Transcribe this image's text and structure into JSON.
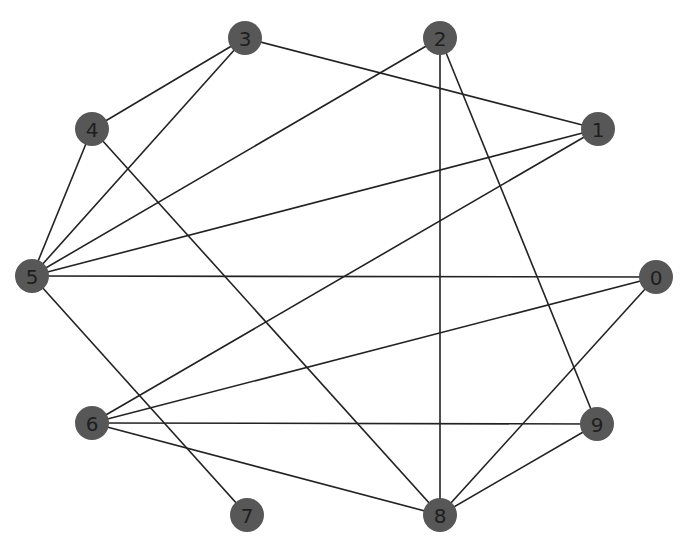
{
  "graph": {
    "node_radius": 17,
    "colors": {
      "node_fill": "#575757",
      "label": "#1e1e1e",
      "edge": "#222222",
      "background": "#ffffff"
    },
    "nodes": [
      {
        "id": "0",
        "label": "0",
        "x": 656,
        "y": 277
      },
      {
        "id": "1",
        "label": "1",
        "x": 598,
        "y": 129
      },
      {
        "id": "2",
        "label": "2",
        "x": 440,
        "y": 38
      },
      {
        "id": "3",
        "label": "3",
        "x": 245,
        "y": 38
      },
      {
        "id": "4",
        "label": "4",
        "x": 92,
        "y": 129
      },
      {
        "id": "5",
        "label": "5",
        "x": 32,
        "y": 276
      },
      {
        "id": "6",
        "label": "6",
        "x": 92,
        "y": 423
      },
      {
        "id": "7",
        "label": "7",
        "x": 247,
        "y": 515
      },
      {
        "id": "8",
        "label": "8",
        "x": 440,
        "y": 515
      },
      {
        "id": "9",
        "label": "9",
        "x": 597,
        "y": 424
      }
    ],
    "edges": [
      [
        "3",
        "4"
      ],
      [
        "3",
        "5"
      ],
      [
        "3",
        "1"
      ],
      [
        "2",
        "5"
      ],
      [
        "2",
        "8"
      ],
      [
        "2",
        "9"
      ],
      [
        "1",
        "5"
      ],
      [
        "1",
        "6"
      ],
      [
        "4",
        "5"
      ],
      [
        "4",
        "8"
      ],
      [
        "5",
        "0"
      ],
      [
        "5",
        "7"
      ],
      [
        "0",
        "6"
      ],
      [
        "0",
        "8"
      ],
      [
        "6",
        "9"
      ],
      [
        "6",
        "8"
      ],
      [
        "9",
        "8"
      ]
    ]
  }
}
